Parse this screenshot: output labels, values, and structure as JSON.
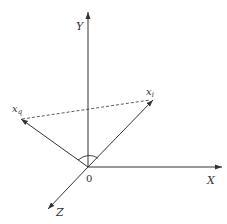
{
  "diagram": {
    "title": "",
    "axes": {
      "y_label": "Y",
      "x_label": "X",
      "z_label": "Z",
      "origin_label": "0"
    },
    "vectors": [
      {
        "name": "x_i",
        "base": "x",
        "sub": "i"
      },
      {
        "name": "x_q",
        "base": "x",
        "sub": "q"
      }
    ],
    "dashed_line": "connects x_q to x_i",
    "angle_arc": "angle between x_q and x_i at origin",
    "colors": {
      "line": "#333333",
      "background": "#ffffff"
    }
  }
}
